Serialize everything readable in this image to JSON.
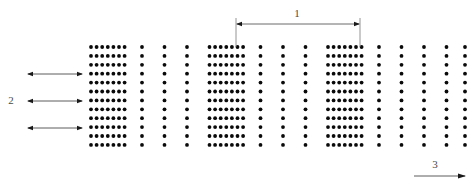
{
  "figure": {
    "width": 471,
    "height": 187,
    "background_color": "#ffffff",
    "dot_color": "#0a0a0a",
    "annotation_color": "#4a4a4a"
  },
  "lattice": {
    "description": "periodic two-dimensional dot lattice with alternating dense and sparse column groups",
    "dot_radius": 1.9,
    "row_count": 12,
    "row_start_y": 47,
    "row_pitch": 8.9,
    "dense_pitch": 5.6,
    "sparse_pitch": 22.5,
    "column_x": [
      91.0,
      96.6,
      102.2,
      107.8,
      113.4,
      119.0,
      124.6,
      142.0,
      164.5,
      187.0,
      209.5,
      215.1,
      220.7,
      226.3,
      231.9,
      237.5,
      243.1,
      260.5,
      283.0,
      305.5,
      328.0,
      333.6,
      339.2,
      344.8,
      350.4,
      356.0,
      361.6,
      379.0,
      401.5,
      424.0,
      446.5,
      465.0
    ]
  },
  "annotations": {
    "dimension_1": {
      "label": "1",
      "label_x": 297,
      "label_y": 14,
      "line_y": 24,
      "x_start": 236,
      "x_end": 360,
      "ext_top_y": 18,
      "ext_bottom_y": 47,
      "arrow_type": "double-headed"
    },
    "flow_2": {
      "label": "2",
      "label_x": 11,
      "label_y": 101,
      "x_start": 27,
      "x_end": 83,
      "arrow_type": "double-headed",
      "rows_y": [
        74,
        101,
        128
      ]
    },
    "axis_3": {
      "label": "3",
      "label_x": 435,
      "label_y": 165,
      "x_start": 414,
      "x_end": 466,
      "line_y": 176,
      "arrow_type": "single-headed-right"
    }
  }
}
